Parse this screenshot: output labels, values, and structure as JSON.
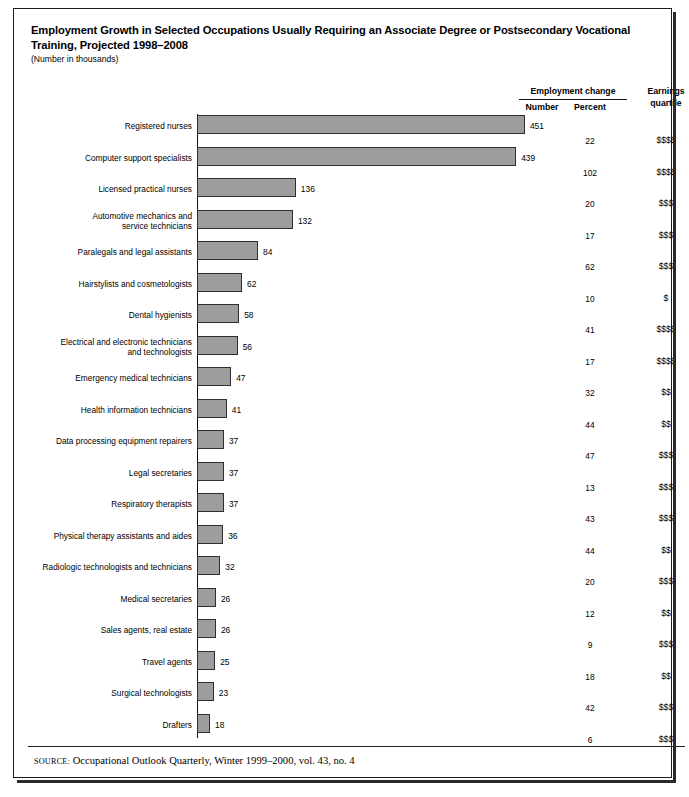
{
  "title": "Employment Growth in Selected Occupations Usually Requiring an Associate Degree or Postsecondary Vocational Training, Projected 1998–2008",
  "subtitle": "(Number in thousands)",
  "headers": {
    "group": "Employment change",
    "number": "Number",
    "percent": "Percent",
    "earnings": "Earnings quartile",
    "earnings_line1": "Earnings",
    "earnings_line2": "quartile"
  },
  "source": {
    "label": "SOURCE:",
    "text": "Occupational Outlook Quarterly, Winter 1999–2000, vol. 43, no. 4"
  },
  "colors": {
    "bar_fill": "#9d9d9d",
    "bar_stroke": "#2e2e2e",
    "border": "#1a1a1a",
    "text": "#000000"
  },
  "chart_data": {
    "type": "bar",
    "title": "Employment Growth in Selected Occupations Usually Requiring an Associate Degree or Postsecondary Vocational Training, Projected 1998–2008",
    "subtitle": "(Number in thousands)",
    "orientation": "horizontal",
    "xlabel": "",
    "ylabel": "",
    "xlim": [
      0,
      460
    ],
    "grid": false,
    "legend": null,
    "categories": [
      "Registered nurses",
      "Computer support specialists",
      "Licensed practical nurses",
      "Automotive mechanics and service technicians",
      "Paralegals and legal assistants",
      "Hairstylists and cosmetologists",
      "Dental hygienists",
      "Electrical and electronic technicians and technologists",
      "Emergency medical technicians",
      "Health information technicians",
      "Data processing equipment repairers",
      "Legal secretaries",
      "Respiratory therapists",
      "Physical therapy assistants and aides",
      "Radiologic technologists and technicians",
      "Medical secretaries",
      "Sales agents, real estate",
      "Travel agents",
      "Surgical technologists",
      "Drafters"
    ],
    "values": [
      451,
      439,
      136,
      132,
      84,
      62,
      58,
      56,
      47,
      41,
      37,
      37,
      37,
      36,
      32,
      26,
      26,
      25,
      23,
      18
    ],
    "percent_change": [
      22,
      102,
      20,
      17,
      62,
      10,
      41,
      17,
      32,
      44,
      47,
      13,
      43,
      44,
      20,
      12,
      9,
      18,
      42,
      6
    ],
    "earnings_quartile": [
      "$$$$",
      "$$$$",
      "$$$",
      "$$$",
      "$$$",
      "$",
      "$$$$",
      "$$$$",
      "$$",
      "$$",
      "$$$",
      "$$$",
      "$$$",
      "$$",
      "$$$",
      "$$",
      "$$$",
      "$$",
      "$$$",
      "$$$"
    ]
  },
  "rows": [
    {
      "label_lines": [
        "Registered nurses"
      ],
      "number": 451,
      "percent": 22,
      "earnings": "$$$$"
    },
    {
      "label_lines": [
        "Computer support specialists"
      ],
      "number": 439,
      "percent": 102,
      "earnings": "$$$$"
    },
    {
      "label_lines": [
        "Licensed practical nurses"
      ],
      "number": 136,
      "percent": 20,
      "earnings": "$$$"
    },
    {
      "label_lines": [
        "Automotive mechanics and",
        "service technicians"
      ],
      "number": 132,
      "percent": 17,
      "earnings": "$$$"
    },
    {
      "label_lines": [
        "Paralegals and legal assistants"
      ],
      "number": 84,
      "percent": 62,
      "earnings": "$$$"
    },
    {
      "label_lines": [
        "Hairstylists and cosmetologists"
      ],
      "number": 62,
      "percent": 10,
      "earnings": "$"
    },
    {
      "label_lines": [
        "Dental hygienists"
      ],
      "number": 58,
      "percent": 41,
      "earnings": "$$$$"
    },
    {
      "label_lines": [
        "Electrical and electronic technicians",
        "and technologists"
      ],
      "number": 56,
      "percent": 17,
      "earnings": "$$$$"
    },
    {
      "label_lines": [
        "Emergency medical technicians"
      ],
      "number": 47,
      "percent": 32,
      "earnings": "$$"
    },
    {
      "label_lines": [
        "Health information technicians"
      ],
      "number": 41,
      "percent": 44,
      "earnings": "$$"
    },
    {
      "label_lines": [
        "Data processing equipment repairers"
      ],
      "number": 37,
      "percent": 47,
      "earnings": "$$$"
    },
    {
      "label_lines": [
        "Legal secretaries"
      ],
      "number": 37,
      "percent": 13,
      "earnings": "$$$"
    },
    {
      "label_lines": [
        "Respiratory therapists"
      ],
      "number": 37,
      "percent": 43,
      "earnings": "$$$"
    },
    {
      "label_lines": [
        "Physical therapy assistants and aides"
      ],
      "number": 36,
      "percent": 44,
      "earnings": "$$"
    },
    {
      "label_lines": [
        "Radiologic technologists and technicians"
      ],
      "number": 32,
      "percent": 20,
      "earnings": "$$$"
    },
    {
      "label_lines": [
        "Medical secretaries"
      ],
      "number": 26,
      "percent": 12,
      "earnings": "$$"
    },
    {
      "label_lines": [
        "Sales agents, real estate"
      ],
      "number": 26,
      "percent": 9,
      "earnings": "$$$"
    },
    {
      "label_lines": [
        "Travel agents"
      ],
      "number": 25,
      "percent": 18,
      "earnings": "$$"
    },
    {
      "label_lines": [
        "Surgical technologists"
      ],
      "number": 23,
      "percent": 42,
      "earnings": "$$$"
    },
    {
      "label_lines": [
        "Drafters"
      ],
      "number": 18,
      "percent": 6,
      "earnings": "$$$"
    }
  ]
}
